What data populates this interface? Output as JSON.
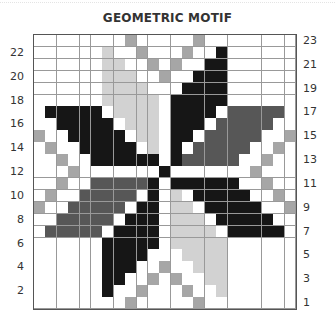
{
  "title": "GEOMETRIC MOTIF",
  "grid": {
    "columns": 23,
    "rows": 23,
    "row_labels_left": [
      "22",
      "20",
      "18",
      "16",
      "14",
      "12",
      "10",
      "8",
      "6",
      "4",
      "2"
    ],
    "row_labels_right": [
      "23",
      "21",
      "19",
      "17",
      "15",
      "13",
      "11",
      "9",
      "7",
      "5",
      "3",
      "1"
    ],
    "palette": {
      "0": "#ffffff",
      "1": "#d2d2d2",
      "2": "#a6a6a6",
      "3": "#575757",
      "4": "#161616"
    },
    "palette_names": {
      "0": "white",
      "1": "light-gray",
      "2": "medium-gray",
      "3": "dark-gray",
      "4": "black"
    },
    "cells": [
      "00000000200000200000000",
      "00000010020002004000000",
      "00000011002020044000000",
      "00000011100200444000000",
      "00000011110004444000000",
      "00000011111044444000000",
      "04444401111044440333330",
      "00444440111044403333300",
      "20044444011044033333002",
      "02004444401040333330020",
      "00200444444043333300200",
      "00020000000400000002000",
      "00200333334044444400200",
      "02003333304010444440020",
      "20033333044011044444002",
      "00333330444011104444400",
      "03333304444011110444440",
      "00000044444011111000000",
      "00000044440001111000000",
      "00000044400200111000000",
      "00000044002020011000000",
      "00000040020002001000000",
      "00000000200000200000000"
    ]
  }
}
